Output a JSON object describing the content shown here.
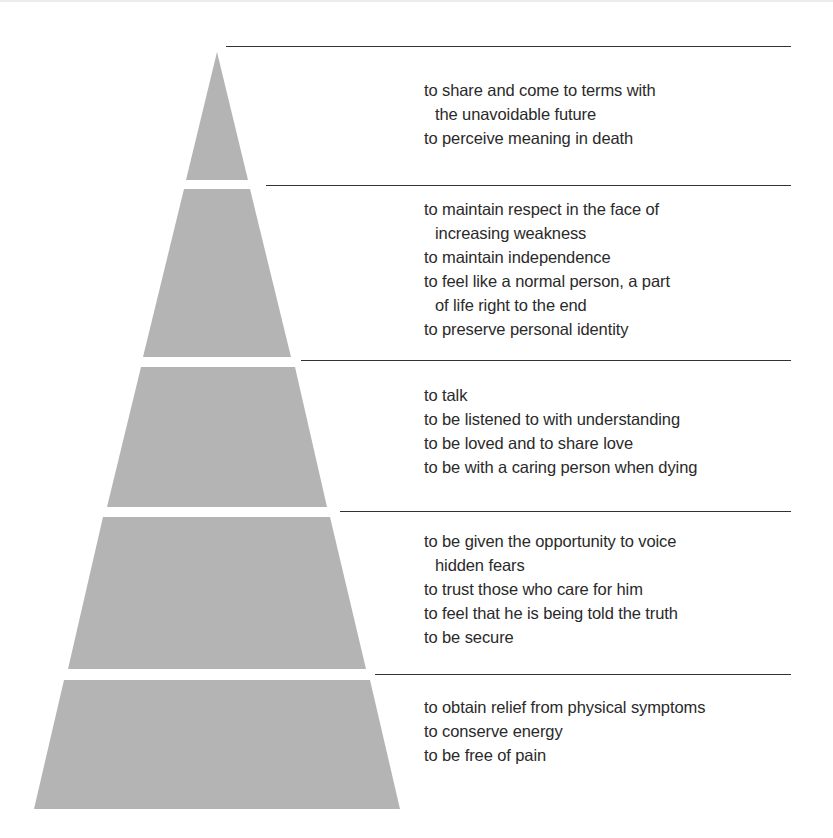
{
  "diagram": {
    "type": "pyramid",
    "fill_color": "#b4b4b4",
    "rule_color": "#333333",
    "tiers": [
      {
        "level": 5,
        "position": "top",
        "lines": [
          {
            "text": "to share and come to terms with",
            "continuation": false
          },
          {
            "text": "the unavoidable future",
            "continuation": true
          },
          {
            "text": "to perceive meaning in death",
            "continuation": false
          }
        ]
      },
      {
        "level": 4,
        "position": "second",
        "lines": [
          {
            "text": "to maintain respect in the face of",
            "continuation": false
          },
          {
            "text": "increasing weakness",
            "continuation": true
          },
          {
            "text": "to maintain independence",
            "continuation": false
          },
          {
            "text": "to feel like a normal person, a part",
            "continuation": false
          },
          {
            "text": "of life right to the end",
            "continuation": true
          },
          {
            "text": "to preserve personal identity",
            "continuation": false
          }
        ]
      },
      {
        "level": 3,
        "position": "middle",
        "lines": [
          {
            "text": "to talk",
            "continuation": false
          },
          {
            "text": "to be listened to with understanding",
            "continuation": false
          },
          {
            "text": "to be loved and to share love",
            "continuation": false
          },
          {
            "text": "to be with a caring person when dying",
            "continuation": false
          }
        ]
      },
      {
        "level": 2,
        "position": "fourth",
        "lines": [
          {
            "text": "to be given the opportunity to voice",
            "continuation": false
          },
          {
            "text": "hidden fears",
            "continuation": true
          },
          {
            "text": "to trust those who care for him",
            "continuation": false
          },
          {
            "text": "to feel that he is being told the truth",
            "continuation": false
          },
          {
            "text": "to be secure",
            "continuation": false
          }
        ]
      },
      {
        "level": 1,
        "position": "base",
        "lines": [
          {
            "text": "to obtain relief from physical symptoms",
            "continuation": false
          },
          {
            "text": "to conserve energy",
            "continuation": false
          },
          {
            "text": "to be free of pain",
            "continuation": false
          }
        ]
      }
    ]
  }
}
